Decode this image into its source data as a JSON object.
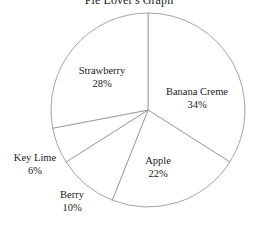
{
  "chart_data": {
    "type": "pie",
    "title": "Pie Lover's Graph",
    "xlabel": "",
    "ylabel": "",
    "legend": "none",
    "grid": false,
    "start_angle_deg": 90,
    "direction": "clockwise",
    "categories": [
      "Banana Creme",
      "Apple",
      "Berry",
      "Key Lime",
      "Strawberry"
    ],
    "values": [
      34,
      22,
      10,
      6,
      28
    ],
    "unit": "%",
    "slices": [
      {
        "label": "Banana Creme",
        "value": 34,
        "value_text": "34%",
        "label_position": "inside"
      },
      {
        "label": "Apple",
        "value": 22,
        "value_text": "22%",
        "label_position": "inside"
      },
      {
        "label": "Berry",
        "value": 10,
        "value_text": "10%",
        "label_position": "outside"
      },
      {
        "label": "Key Lime",
        "value": 6,
        "value_text": "6%",
        "label_position": "outside"
      },
      {
        "label": "Strawberry",
        "value": 28,
        "value_text": "28%",
        "label_position": "inside"
      }
    ],
    "style": {
      "fill": "#ffffff",
      "stroke": "#9a9a9a",
      "background": "#ffffff",
      "text": "#1a1a1a"
    }
  }
}
